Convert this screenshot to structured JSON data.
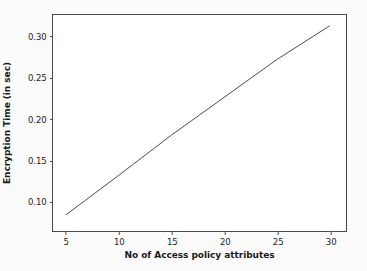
{
  "chart_data": {
    "type": "line",
    "title": "",
    "xlabel": "No of Access policy attributes",
    "ylabel": "Encryption Time (in sec)",
    "xlim": [
      3.75,
      31.4
    ],
    "ylim": [
      0.0655,
      0.3265
    ],
    "xticks": [
      5,
      10,
      15,
      20,
      25,
      30
    ],
    "xtick_labels": [
      "5",
      "10",
      "15",
      "20",
      "25",
      "30"
    ],
    "yticks": [
      0.1,
      0.15,
      0.2,
      0.25,
      0.3
    ],
    "ytick_labels": [
      "0.10",
      "0.15",
      "0.20",
      "0.25",
      "0.30"
    ],
    "grid": false,
    "legend": null,
    "series": [
      {
        "name": "Encryption Time",
        "color": "#4a4a4a",
        "linewidth": 1.0,
        "x": [
          5,
          10,
          15,
          20,
          25,
          30
        ],
        "values": [
          0.083,
          0.131,
          0.18,
          0.226,
          0.272,
          0.313
        ]
      }
    ]
  },
  "figure": {
    "background_color": "#fbfbfb",
    "axes_background_color": "#ffffff",
    "axes_edge_color": "#4a4a4a",
    "tick_color": "#222222"
  }
}
